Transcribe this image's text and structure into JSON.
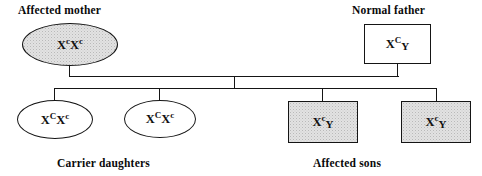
{
  "diagram": {
    "colors": {
      "stroke": "#151515",
      "affected_fill": "#e2e2e2",
      "unaffected_fill": "#ffffff",
      "text": "#0a0a0a"
    }
  },
  "labels": {
    "mother": "Affected mother",
    "father": "Normal father",
    "daughters": "Carrier daughters",
    "sons": "Affected sons"
  },
  "generation1": [
    {
      "id": "mother",
      "sex": "female",
      "shape": "ellipse",
      "status": "affected",
      "genotype": "XcXc",
      "allele1": "X",
      "sup1": "c",
      "allele2": "X",
      "sup2": "c"
    },
    {
      "id": "father",
      "sex": "male",
      "shape": "square",
      "status": "unaffected",
      "genotype": "XCY",
      "allele1": "X",
      "sup1": "C",
      "allele2": "Y"
    }
  ],
  "generation2": [
    {
      "id": "daughter-1",
      "sex": "female",
      "shape": "ellipse",
      "status": "carrier",
      "genotype": "XCXc",
      "allele1": "X",
      "sup1": "C",
      "allele2": "X",
      "sup2": "c"
    },
    {
      "id": "daughter-2",
      "sex": "female",
      "shape": "ellipse",
      "status": "carrier",
      "genotype": "XCXc",
      "allele1": "X",
      "sup1": "C",
      "allele2": "X",
      "sup2": "c"
    },
    {
      "id": "son-1",
      "sex": "male",
      "shape": "square",
      "status": "affected",
      "genotype": "XcY",
      "allele1": "X",
      "sup1": "c",
      "allele2": "Y"
    },
    {
      "id": "son-2",
      "sex": "male",
      "shape": "square",
      "status": "affected",
      "genotype": "XcY",
      "allele1": "X",
      "sup1": "c",
      "allele2": "Y"
    }
  ]
}
